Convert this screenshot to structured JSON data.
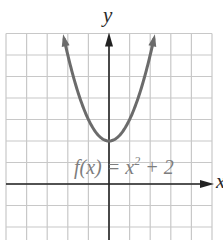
{
  "chart_data": {
    "type": "line",
    "title": "",
    "xlabel": "x",
    "ylabel": "y",
    "function_label": "f(x) = x^2 + 2",
    "function_label_parts": {
      "lhs": "f(x) = x",
      "exp": "2",
      "rhs": " + 2"
    },
    "xlim": [
      -5,
      5
    ],
    "ylim": [
      -3,
      7
    ],
    "grid": true,
    "grid_step": 1,
    "tick_labels_shown": false,
    "series": [
      {
        "name": "f(x) = x^2 + 2",
        "x": [
          -2.24,
          -2,
          -1.5,
          -1,
          -0.5,
          0,
          0.5,
          1,
          1.5,
          2,
          2.24
        ],
        "values": [
          7.0,
          6,
          4.25,
          3,
          2.25,
          2,
          2.25,
          3,
          4.25,
          6,
          7.0
        ],
        "color": "#6b6b6b",
        "arrows_at_ends": true
      }
    ],
    "vertex": {
      "x": 0,
      "y": 2
    }
  },
  "colors": {
    "grid": "#c8c8c8",
    "axis": "#222222",
    "curve": "#6b6b6b",
    "equation_text": "#7d7d7d"
  }
}
